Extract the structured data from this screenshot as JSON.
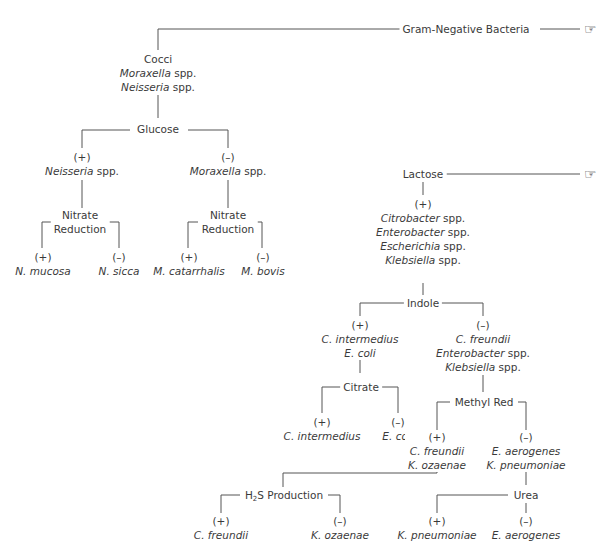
{
  "diagram": {
    "title": "Gram-Negative Bacteria",
    "continuation_icon": "pointing-hand-icon",
    "nodes": {
      "root": {
        "label": "Gram-Negative Bacteria"
      },
      "cocci": {
        "lines": [
          {
            "it": "",
            "rest": "Cocci"
          },
          {
            "it": "Moraxella",
            "rest": " spp."
          },
          {
            "it": "Neisseria",
            "rest": " spp."
          }
        ]
      },
      "glucose": {
        "label": "Glucose"
      },
      "glucose_pos": {
        "sign": "(+)",
        "it": "Neisseria",
        "rest": " spp."
      },
      "glucose_neg": {
        "sign": "(–)",
        "it": "Moraxella",
        "rest": " spp."
      },
      "nitrate_left": {
        "line1": "Nitrate",
        "line2": "Reduction"
      },
      "nitrate_right": {
        "line1": "Nitrate",
        "line2": "Reduction"
      },
      "n_mucosa": {
        "sign": "(+)",
        "name": "N. mucosa"
      },
      "n_sicca": {
        "sign": "(–)",
        "name": "N. sicca"
      },
      "m_catarrhalis": {
        "sign": "(+)",
        "name": "M. catarrhalis"
      },
      "m_bovis": {
        "sign": "(–)",
        "name": "M. bovis"
      },
      "lactose": {
        "label": "Lactose"
      },
      "lactose_pos": {
        "sign": "(+)",
        "lines": [
          {
            "it": "Citrobacter",
            "rest": " spp."
          },
          {
            "it": "Enterobacter",
            "rest": " spp."
          },
          {
            "it": "Escherichia",
            "rest": " spp."
          },
          {
            "it": "Klebsiella",
            "rest": " spp."
          }
        ]
      },
      "indole": {
        "label": "Indole"
      },
      "indole_pos": {
        "sign": "(+)",
        "line1": "C. intermedius",
        "line2": "E. coli"
      },
      "indole_neg": {
        "sign": "(–)",
        "line1": "C. freundii",
        "line2_it": "Enterobacter",
        "line2_rest": " spp.",
        "line3_it": "Klebsiella",
        "line3_rest": " spp."
      },
      "citrate": {
        "label": "Citrate"
      },
      "citrate_pos": {
        "sign": "(+)",
        "name": "C. intermedius"
      },
      "citrate_neg": {
        "sign": "(–)",
        "name": "E. coli"
      },
      "methyl_red": {
        "label": "Methyl Red"
      },
      "mr_pos": {
        "sign": "(+)",
        "line1": "C. freundii",
        "line2": "K. ozaenae"
      },
      "mr_neg": {
        "sign": "(–)",
        "line1": "E. aerogenes",
        "line2": "K. pneumoniae"
      },
      "h2s": {
        "pre": "H",
        "sub": "2",
        "post": "S Production"
      },
      "h2s_pos": {
        "sign": "(+)",
        "name": "C. freundii"
      },
      "h2s_neg": {
        "sign": "(–)",
        "name": "K. ozaenae"
      },
      "urea": {
        "label": "Urea"
      },
      "urea_pos": {
        "sign": "(+)",
        "name": "K. pneumoniae"
      },
      "urea_neg": {
        "sign": "(–)",
        "name": "E. aerogenes"
      }
    }
  }
}
